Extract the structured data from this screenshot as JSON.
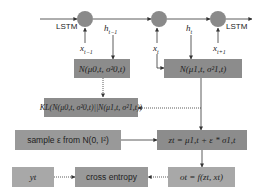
{
  "diagram": {
    "lstm_labels": {
      "left": "LSTM",
      "right": "LSTM"
    },
    "hidden_labels": {
      "h_prev": "h",
      "h_prev_sub": "t−1",
      "h_cur": "h",
      "h_cur_sub": "t"
    },
    "input_labels": {
      "x_prev": "x",
      "x_prev_sub": "t−1",
      "x_cur": "x",
      "x_cur_sub": "t",
      "x_next": "x",
      "x_next_sub": "t+1"
    },
    "boxes": {
      "prior": "N(μ0,t, σ²0,t)",
      "posterior": "N(μ1,t, σ²1,t)",
      "kl": "KL(N(μ0,t, σ²0,t)||N(μ1,t, σ²1,t))",
      "sample": "sample ε from N(0, I²)",
      "z": "zt = μ1,t + ε * σ1,t",
      "y": "yt",
      "cross_entropy": "cross entropy",
      "output": "ot = f(zt, xt)"
    },
    "colors": {
      "node_fill": "#8a8a8a",
      "box_dark": "#8c8c8c",
      "box_light": "#a8a8a8",
      "line": "#333333"
    }
  }
}
